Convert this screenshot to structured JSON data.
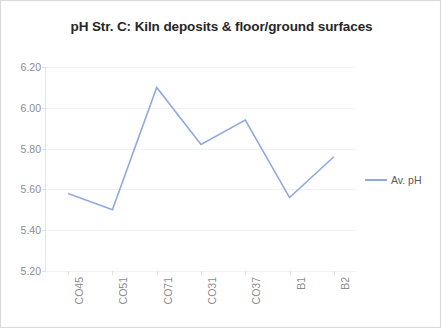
{
  "chart_data": {
    "type": "line",
    "title": "pH Str. C: Kiln deposits & floor/ground surfaces",
    "xlabel": "",
    "ylabel": "",
    "categories": [
      "CO45",
      "CO51",
      "CO71",
      "CO31",
      "CO37",
      "B1",
      "B2"
    ],
    "series": [
      {
        "name": "Av. pH",
        "color": "#8faadc",
        "values": [
          5.58,
          5.5,
          6.1,
          5.82,
          5.94,
          5.56,
          5.76
        ]
      }
    ],
    "ylim": [
      5.2,
      6.2
    ],
    "yticks": [
      "5.20",
      "5.40",
      "5.60",
      "5.80",
      "6.00",
      "6.20"
    ],
    "ytick_values": [
      5.2,
      5.4,
      5.6,
      5.8,
      6.0,
      6.2
    ],
    "grid": true,
    "legend_position": "right",
    "legend_entries": [
      "Av. pH"
    ]
  },
  "legend": {
    "label": "Av. pH"
  },
  "colors": {
    "series_line": "#8faadc",
    "gridline": "#f2f2f2",
    "axis": "#e0e0e0",
    "tick_text": "#8c8c8c",
    "title_text": "#262626",
    "frame_border": "#d9d9d9",
    "background": "#ffffff"
  }
}
